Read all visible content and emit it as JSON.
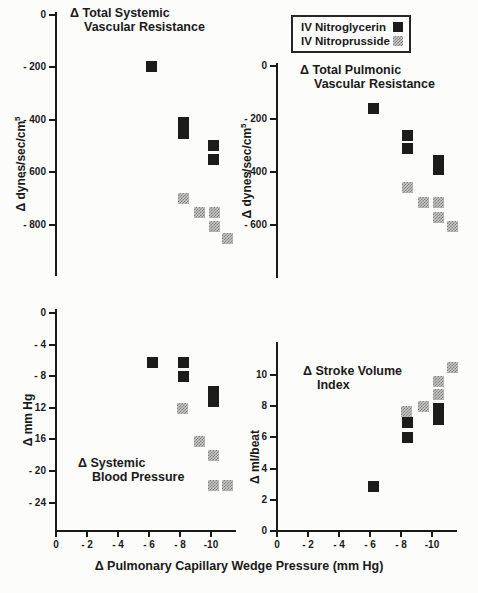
{
  "figure": {
    "background": "#fcfcfa",
    "text_color": "#1a1a1a"
  },
  "legend": {
    "position": "top-right",
    "items": [
      {
        "label": "IV Nitroglycerin",
        "marker": "black-square",
        "color": "#1c1c1c"
      },
      {
        "label": "IV Nitroprusside",
        "marker": "gray-square",
        "color": "#a8a8a8"
      }
    ]
  },
  "xlabel": "Δ Pulmonary Capillary Wedge Pressure (mm Hg)",
  "chart_data": [
    {
      "type": "scatter",
      "title_lines": [
        "Δ Total Systemic",
        "Vascular Resistance"
      ],
      "ylabel": "Δ dynes/sec/cm",
      "ylabel_sup": "5",
      "xlim": [
        0,
        -11.5
      ],
      "ylim": [
        0,
        -1000
      ],
      "grid": false,
      "x_axis_shown": false,
      "yticks": {
        "values": [
          0,
          -200,
          -400,
          -600,
          -800
        ],
        "labels": [
          "0",
          "- 200",
          "- 400",
          "- 600",
          "- 800"
        ]
      },
      "series": [
        {
          "name": "IV Nitroglycerin",
          "marker": "black",
          "points": [
            [
              -6.1,
              -195
            ],
            [
              -8.2,
              -410
            ],
            [
              -8.2,
              -450
            ],
            [
              -10.1,
              -495
            ],
            [
              -10.1,
              -550
            ]
          ]
        },
        {
          "name": "IV Nitroprusside",
          "marker": "gray",
          "points": [
            [
              -8.2,
              -700
            ],
            [
              -9.2,
              -750
            ],
            [
              -10.2,
              -750
            ],
            [
              -10.2,
              -805
            ],
            [
              -11.0,
              -850
            ]
          ]
        }
      ]
    },
    {
      "type": "scatter",
      "title_lines": [
        "Δ Total Pulmonic",
        "Vascular Resistance"
      ],
      "ylabel": "Δ dynes/sec/cm",
      "ylabel_sup": "5",
      "xlim": [
        0,
        -11.5
      ],
      "ylim": [
        0,
        -800
      ],
      "grid": false,
      "x_axis_shown": false,
      "yticks": {
        "values": [
          0,
          -200,
          -400,
          -600
        ],
        "labels": [
          "0",
          "- 200",
          "- 400",
          "- 600"
        ]
      },
      "series": [
        {
          "name": "IV Nitroglycerin",
          "marker": "black",
          "points": [
            [
              -6.2,
              -160
            ],
            [
              -8.4,
              -260
            ],
            [
              -8.4,
              -310
            ],
            [
              -10.4,
              -355
            ],
            [
              -10.4,
              -390
            ]
          ]
        },
        {
          "name": "IV Nitroprusside",
          "marker": "gray",
          "points": [
            [
              -8.4,
              -455
            ],
            [
              -9.4,
              -515
            ],
            [
              -10.4,
              -515
            ],
            [
              -10.4,
              -570
            ],
            [
              -11.3,
              -605
            ]
          ]
        }
      ]
    },
    {
      "type": "scatter",
      "title_lines": [
        "Δ Systemic",
        "Blood Pressure"
      ],
      "ylabel": "Δ mm Hg",
      "xlim": [
        0,
        -11.5
      ],
      "ylim": [
        0,
        -27
      ],
      "grid": false,
      "x_axis_shown": true,
      "yticks": {
        "values": [
          0,
          -4,
          -8,
          -12,
          -16,
          -20,
          -24
        ],
        "labels": [
          "0",
          "- 4",
          "- 8",
          "- 12",
          "- 16",
          "- 20",
          "- 24"
        ]
      },
      "xticks": {
        "values": [
          0,
          -2,
          -4,
          -6,
          -8,
          -10
        ],
        "labels": [
          "0",
          "- 2",
          "- 4",
          "- 6",
          "- 8",
          "-10"
        ]
      },
      "series": [
        {
          "name": "IV Nitroglycerin",
          "marker": "black",
          "points": [
            [
              -6.2,
              -6.2
            ],
            [
              -8.2,
              -6.2
            ],
            [
              -8.2,
              -8.0
            ],
            [
              -10.1,
              -9.9
            ],
            [
              -10.1,
              -11.2
            ]
          ]
        },
        {
          "name": "IV Nitroprusside",
          "marker": "gray",
          "points": [
            [
              -8.1,
              -12.0
            ],
            [
              -9.2,
              -16.2
            ],
            [
              -10.1,
              -18.0
            ],
            [
              -10.1,
              -21.8
            ],
            [
              -11.0,
              -21.8
            ]
          ]
        }
      ]
    },
    {
      "type": "scatter",
      "title_lines": [
        "Δ Stroke Volume",
        "Index"
      ],
      "ylabel": "Δ ml/beat",
      "xlim": [
        0,
        -11.5
      ],
      "ylim": [
        0,
        12
      ],
      "grid": false,
      "x_axis_shown": true,
      "yticks": {
        "values": [
          0,
          2,
          4,
          6,
          8,
          10
        ],
        "labels": [
          "0",
          "2",
          "4",
          "6",
          "8",
          "10"
        ]
      },
      "xticks": {
        "values": [
          0,
          -2,
          -4,
          -6,
          -8,
          -10
        ],
        "labels": [
          "0",
          "- 2",
          "- 4",
          "- 6",
          "- 8",
          "-10"
        ]
      },
      "series": [
        {
          "name": "IV Nitroglycerin",
          "marker": "black",
          "points": [
            [
              -6.2,
              2.9
            ],
            [
              -8.4,
              6.0
            ],
            [
              -8.4,
              7.0
            ],
            [
              -10.4,
              7.2
            ],
            [
              -10.4,
              7.9
            ]
          ]
        },
        {
          "name": "IV Nitroprusside",
          "marker": "gray",
          "points": [
            [
              -8.3,
              7.7
            ],
            [
              -9.4,
              8.0
            ],
            [
              -10.4,
              8.8
            ],
            [
              -10.4,
              9.6
            ],
            [
              -11.3,
              10.5
            ]
          ]
        }
      ]
    }
  ]
}
